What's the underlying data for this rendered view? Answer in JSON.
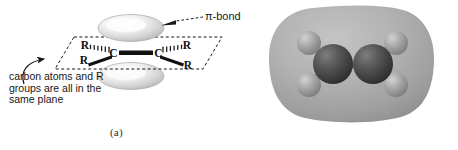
{
  "figure": {
    "panels": [
      {
        "id": "a",
        "caption": "(a)",
        "type": "orbital-diagram",
        "annotations": {
          "pi_bond": "π-bond",
          "plane_note": "carbon atoms and R\ngroups are all in the\nsame plane"
        },
        "atoms": [
          {
            "label": "C",
            "role": "carbon-left"
          },
          {
            "label": "C",
            "role": "carbon-right"
          }
        ],
        "substituents": [
          {
            "label": "R",
            "position": "upper-left",
            "bond": "hashed-wedge"
          },
          {
            "label": "R",
            "position": "lower-left",
            "bond": "solid-wedge"
          },
          {
            "label": "R",
            "position": "upper-right",
            "bond": "hashed-wedge"
          },
          {
            "label": "R",
            "position": "lower-right",
            "bond": "solid-wedge"
          }
        ],
        "lobes": [
          {
            "role": "p-orbital-lobe-top"
          },
          {
            "role": "p-orbital-lobe-bottom"
          }
        ],
        "bond": {
          "role": "carbon-carbon-double-bond",
          "style": "thick-bar"
        },
        "plane": {
          "role": "molecular-plane",
          "style": "dashed-parallelogram"
        }
      },
      {
        "id": "b",
        "caption": "(b)",
        "type": "space-filling-model",
        "molecule": "ethene",
        "spheres": [
          {
            "element": "C",
            "role": "carbon-left"
          },
          {
            "element": "C",
            "role": "carbon-right"
          },
          {
            "element": "H",
            "role": "hydrogen-upper-left"
          },
          {
            "element": "H",
            "role": "hydrogen-lower-left"
          },
          {
            "element": "H",
            "role": "hydrogen-upper-right"
          },
          {
            "element": "H",
            "role": "hydrogen-lower-right"
          }
        ],
        "surface": {
          "role": "electron-density-surface"
        }
      }
    ]
  },
  "colors": {
    "background": "#ffffff",
    "ink": "#171717",
    "lobe_fill": "#d8d8d8",
    "lobe_highlight": "#ffffff",
    "density_cloud": "#a9a9a9",
    "carbon_sphere": "#4a4a4a",
    "hydrogen_sphere": "#9d9d9d"
  }
}
